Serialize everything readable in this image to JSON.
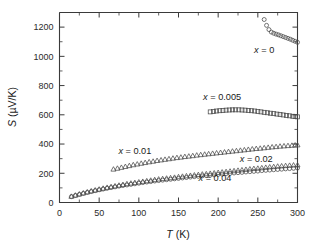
{
  "figure": {
    "width": 315,
    "height": 246,
    "background": "#ffffff"
  },
  "chart_data": {
    "type": "scatter",
    "title": "",
    "xlabel": "T (K)",
    "xlabel_italic_part": "T",
    "xlabel_rest": " (K)",
    "ylabel": "S (µV/K)",
    "ylabel_italic_part": "S",
    "ylabel_rest": " (µV/K)",
    "xlim": [
      0,
      300
    ],
    "ylim": [
      0,
      1300
    ],
    "xticks": [
      0,
      50,
      100,
      150,
      200,
      250,
      300
    ],
    "xticklabels": [
      "0",
      "50",
      "100",
      "150",
      "200",
      "250",
      "300"
    ],
    "xminor_step": 25,
    "yticks": [
      0,
      200,
      400,
      600,
      800,
      1000,
      1200
    ],
    "yticklabels": [
      "0",
      "200",
      "400",
      "600",
      "800",
      "1000",
      "1200"
    ],
    "yminor_step": 100,
    "grid": false,
    "legend_position": "inline-annotations",
    "marker_color": "#4a4a4a",
    "axis_color": "#3a3a3a",
    "series": [
      {
        "name": "x = 0",
        "label_text": "= 0",
        "label_italic": "x",
        "marker": "circle",
        "label_x": 258,
        "label_y": 1020,
        "x": [
          258,
          261,
          264,
          267,
          270,
          273,
          276,
          279,
          282,
          285,
          288,
          291,
          294,
          297,
          300
        ],
        "y": [
          1252,
          1212,
          1183,
          1166,
          1158,
          1152,
          1147,
          1141,
          1135,
          1129,
          1123,
          1117,
          1110,
          1103,
          1096
        ]
      },
      {
        "name": "x = 0.005",
        "label_text": "= 0.005",
        "label_italic": "x",
        "marker": "square",
        "label_x": 205,
        "label_y": 700,
        "x": [
          190,
          194,
          198,
          202,
          206,
          210,
          214,
          218,
          222,
          226,
          230,
          234,
          238,
          242,
          246,
          250,
          254,
          258,
          262,
          266,
          270,
          274,
          278,
          282,
          286,
          290,
          294,
          297,
          300
        ],
        "y": [
          620,
          623,
          626,
          628,
          630,
          632,
          633,
          634,
          634,
          634,
          633,
          632,
          630,
          628,
          626,
          623,
          620,
          617,
          614,
          611,
          608,
          605,
          602,
          599,
          596,
          593,
          590,
          588,
          586
        ]
      },
      {
        "name": "x = 0.01",
        "label_text": "= 0.01",
        "label_italic": "x",
        "marker": "triangle",
        "label_x": 95,
        "label_y": 330,
        "x": [
          68,
          73,
          78,
          83,
          88,
          93,
          98,
          103,
          108,
          113,
          118,
          123,
          128,
          133,
          138,
          143,
          148,
          153,
          158,
          163,
          168,
          173,
          178,
          183,
          188,
          193,
          198,
          203,
          208,
          213,
          218,
          223,
          228,
          233,
          238,
          243,
          248,
          253,
          258,
          263,
          268,
          273,
          278,
          283,
          288,
          293,
          297,
          300
        ],
        "y": [
          228,
          234,
          240,
          246,
          252,
          258,
          263,
          268,
          273,
          278,
          282,
          287,
          291,
          295,
          299,
          303,
          307,
          310,
          314,
          317,
          320,
          324,
          327,
          330,
          333,
          336,
          339,
          342,
          345,
          348,
          351,
          354,
          357,
          360,
          363,
          366,
          369,
          371,
          374,
          377,
          380,
          382,
          385,
          387,
          389,
          391,
          393,
          394
        ]
      },
      {
        "name": "x = 0.02",
        "label_text": "= 0.02",
        "label_italic": "x",
        "marker": "triangle",
        "label_x": 248,
        "label_y": 277,
        "x": [
          15,
          20,
          25,
          30,
          35,
          40,
          45,
          50,
          55,
          60,
          65,
          70,
          75,
          80,
          85,
          90,
          95,
          100,
          105,
          110,
          115,
          120,
          125,
          130,
          135,
          140,
          145,
          150,
          155,
          160,
          165,
          170,
          175,
          180,
          185,
          190,
          195,
          200,
          205,
          210,
          215,
          220,
          225,
          230,
          235,
          240,
          245,
          250,
          255,
          260,
          265,
          270,
          275,
          280,
          285,
          290,
          295,
          300
        ],
        "y": [
          42,
          50,
          58,
          65,
          72,
          79,
          85,
          91,
          97,
          103,
          108,
          113,
          118,
          123,
          128,
          132,
          136,
          140,
          144,
          148,
          152,
          156,
          160,
          163,
          166,
          169,
          172,
          176,
          179,
          182,
          185,
          188,
          191,
          194,
          196,
          199,
          202,
          205,
          208,
          211,
          214,
          217,
          220,
          223,
          226,
          229,
          232,
          234,
          237,
          240,
          243,
          245,
          248,
          250,
          252,
          254,
          256,
          257
        ]
      },
      {
        "name": "x = 0.04",
        "label_text": "= 0.04",
        "label_italic": "x",
        "marker": "circle",
        "label_x": 196,
        "label_y": 148,
        "x": [
          15,
          20,
          25,
          30,
          35,
          40,
          45,
          50,
          55,
          60,
          65,
          70,
          75,
          80,
          85,
          90,
          95,
          100,
          105,
          110,
          115,
          120,
          125,
          130,
          135,
          140,
          145,
          150,
          155,
          160,
          165,
          170,
          175,
          180,
          185,
          190,
          195,
          200,
          205,
          210,
          215,
          220,
          225,
          230,
          235,
          240,
          245,
          250,
          255,
          260,
          265,
          270,
          275,
          280,
          285,
          290,
          295,
          300
        ],
        "y": [
          40,
          48,
          55,
          62,
          69,
          75,
          81,
          87,
          92,
          97,
          102,
          107,
          112,
          116,
          120,
          124,
          128,
          132,
          136,
          140,
          143,
          147,
          150,
          153,
          156,
          159,
          162,
          165,
          168,
          171,
          174,
          177,
          179,
          182,
          184,
          187,
          189,
          192,
          194,
          197,
          199,
          202,
          204,
          206,
          209,
          211,
          213,
          215,
          218,
          220,
          222,
          224,
          226,
          228,
          230,
          232,
          234,
          236
        ]
      }
    ]
  }
}
